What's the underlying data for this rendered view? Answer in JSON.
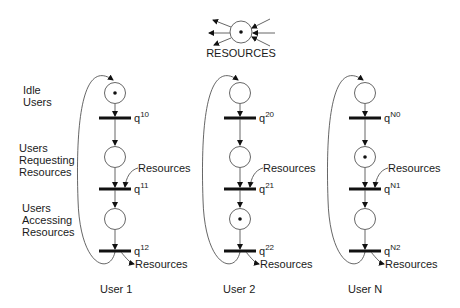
{
  "resources_place": {
    "label": "RESOURCES",
    "tokens": 1
  },
  "row_labels": {
    "idle": [
      "Idle",
      "Users"
    ],
    "requesting": [
      "Users",
      "Requesting",
      "Resources"
    ],
    "accessing": [
      "Users",
      "Accessing",
      "Resources"
    ]
  },
  "users": [
    {
      "label": "User 1",
      "places": [
        {
          "name": "idle",
          "tokens": 1
        },
        {
          "name": "requesting",
          "tokens": 0
        },
        {
          "name": "accessing",
          "tokens": 0
        }
      ],
      "transitions": [
        {
          "base": "q",
          "sup": "10"
        },
        {
          "base": "q",
          "sup": "11"
        },
        {
          "base": "q",
          "sup": "12"
        }
      ],
      "resource_in_label": "Resources",
      "resource_out_label": "Resources"
    },
    {
      "label": "User 2",
      "places": [
        {
          "name": "idle",
          "tokens": 0
        },
        {
          "name": "requesting",
          "tokens": 0
        },
        {
          "name": "accessing",
          "tokens": 1
        }
      ],
      "transitions": [
        {
          "base": "q",
          "sup": "20"
        },
        {
          "base": "q",
          "sup": "21"
        },
        {
          "base": "q",
          "sup": "22"
        }
      ],
      "resource_in_label": "Resources",
      "resource_out_label": "Resources"
    },
    {
      "label": "User N",
      "places": [
        {
          "name": "idle",
          "tokens": 0
        },
        {
          "name": "requesting",
          "tokens": 1
        },
        {
          "name": "accessing",
          "tokens": 0
        }
      ],
      "transitions": [
        {
          "base": "q",
          "sup": "N0"
        },
        {
          "base": "q",
          "sup": "N1"
        },
        {
          "base": "q",
          "sup": "N2"
        }
      ],
      "resource_in_label": "Resources",
      "resource_out_label": "Resources"
    }
  ],
  "colors": {
    "stroke": "#555555",
    "ink": "#111111",
    "background": "#ffffff"
  }
}
